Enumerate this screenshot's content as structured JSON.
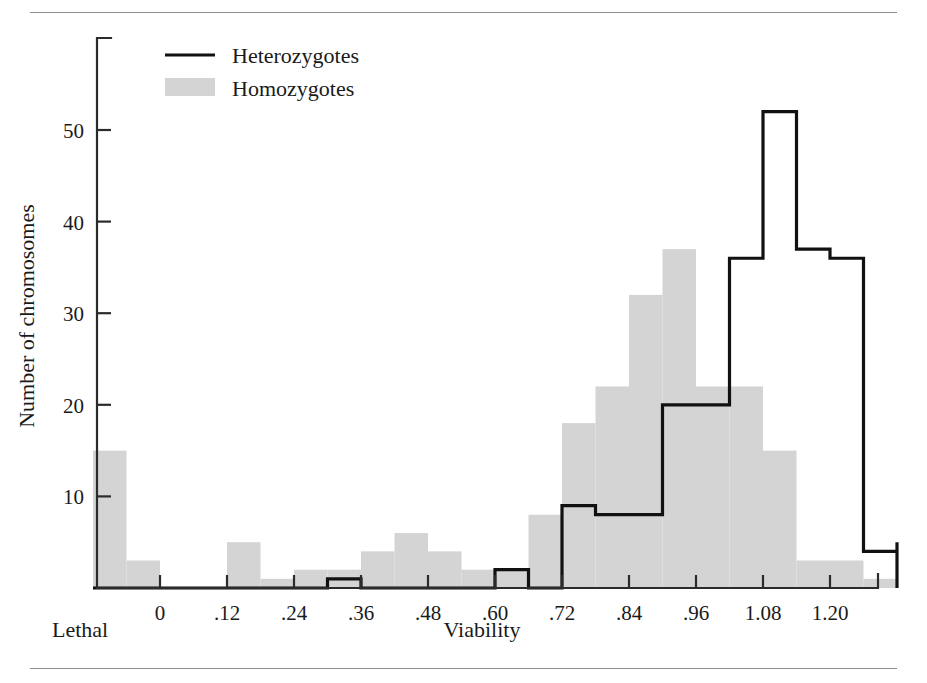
{
  "figure": {
    "rules": {
      "top": "horizontal-rule",
      "bottom": "horizontal-rule"
    },
    "corner_label_left": "Lethal",
    "axis_title_x": "Viability",
    "axis_title_y": "Number of chromosomes"
  },
  "legend": {
    "position": "top-left-inside",
    "entries": [
      {
        "label": "Heterozygotes",
        "marker": "line",
        "color": "#111111"
      },
      {
        "label": "Homozygotes",
        "marker": "swatch",
        "color": "#d4d4d4"
      }
    ]
  },
  "colors": {
    "heterozygote_line": "#111111",
    "homozygote_fill": "#d4d4d4",
    "axis": "#2b2b2b",
    "rule": "#8d8d8d",
    "background": "#ffffff"
  },
  "chart_data": {
    "type": "bar",
    "title": "",
    "subtitle": "",
    "xlabel": "Viability",
    "ylabel": "Number of chromosomes",
    "xlim": [
      -0.12,
      1.32
    ],
    "ylim": [
      0,
      55
    ],
    "grid": false,
    "legend_position": "top-left",
    "bin_width": 0.06,
    "x_ticks": [
      "0",
      ".12",
      ".24",
      ".36",
      ".48",
      ".60",
      ".72",
      ".84",
      ".96",
      "1.08",
      "1.20"
    ],
    "x_tick_values": [
      0,
      0.12,
      0.24,
      0.36,
      0.48,
      0.6,
      0.72,
      0.84,
      0.96,
      1.08,
      1.2
    ],
    "y_ticks": [
      "10",
      "20",
      "30",
      "40",
      "50"
    ],
    "y_tick_values": [
      10,
      20,
      30,
      40,
      50
    ],
    "bin_edges": [
      -0.12,
      -0.06,
      0.0,
      0.06,
      0.12,
      0.18,
      0.24,
      0.3,
      0.36,
      0.42,
      0.48,
      0.54,
      0.6,
      0.66,
      0.72,
      0.78,
      0.84,
      0.9,
      0.96,
      1.02,
      1.08,
      1.14,
      1.2,
      1.26,
      1.32
    ],
    "series": [
      {
        "name": "Homozygotes",
        "style": "filled-bars",
        "color": "#d4d4d4",
        "values": [
          15,
          3,
          0,
          0,
          5,
          1,
          2,
          4,
          6,
          4,
          2,
          2,
          0,
          8,
          18,
          22,
          32,
          37,
          22,
          22,
          15,
          3,
          3,
          1
        ]
      },
      {
        "name": "Heterozygotes",
        "style": "step-outline",
        "color": "#111111",
        "values": [
          0,
          0,
          0,
          0,
          0,
          0,
          0,
          1,
          1,
          0,
          0,
          0,
          0,
          2,
          0,
          9,
          8,
          8,
          20,
          20,
          36,
          52,
          37,
          36,
          4,
          4,
          5,
          5
        ]
      }
    ],
    "heterozygote_steps": [
      {
        "x0": -0.12,
        "x1": 0.3,
        "y": 0
      },
      {
        "x0": 0.3,
        "x1": 0.36,
        "y": 1
      },
      {
        "x0": 0.36,
        "x1": 0.6,
        "y": 0
      },
      {
        "x0": 0.6,
        "x1": 0.66,
        "y": 2
      },
      {
        "x0": 0.66,
        "x1": 0.72,
        "y": 0
      },
      {
        "x0": 0.72,
        "x1": 0.78,
        "y": 9
      },
      {
        "x0": 0.78,
        "x1": 0.9,
        "y": 8
      },
      {
        "x0": 0.9,
        "x1": 1.02,
        "y": 20
      },
      {
        "x0": 1.02,
        "x1": 1.08,
        "y": 36
      },
      {
        "x0": 1.08,
        "x1": 1.14,
        "y": 52
      },
      {
        "x0": 1.14,
        "x1": 1.2,
        "y": 37
      },
      {
        "x0": 1.2,
        "x1": 1.26,
        "y": 36
      },
      {
        "x0": 1.26,
        "x1": 1.32,
        "y": 4
      },
      {
        "x0": 1.32,
        "x1": 1.38,
        "y": 5
      }
    ],
    "homozygote_bars": [
      {
        "x0": -0.12,
        "x1": -0.06,
        "y": 15
      },
      {
        "x0": -0.06,
        "x1": 0.0,
        "y": 3
      },
      {
        "x0": 0.0,
        "x1": 0.06,
        "y": 0
      },
      {
        "x0": 0.06,
        "x1": 0.12,
        "y": 0
      },
      {
        "x0": 0.12,
        "x1": 0.18,
        "y": 5
      },
      {
        "x0": 0.18,
        "x1": 0.24,
        "y": 1
      },
      {
        "x0": 0.24,
        "x1": 0.3,
        "y": 2
      },
      {
        "x0": 0.3,
        "x1": 0.36,
        "y": 2
      },
      {
        "x0": 0.36,
        "x1": 0.42,
        "y": 4
      },
      {
        "x0": 0.42,
        "x1": 0.48,
        "y": 6
      },
      {
        "x0": 0.48,
        "x1": 0.54,
        "y": 4
      },
      {
        "x0": 0.54,
        "x1": 0.6,
        "y": 2
      },
      {
        "x0": 0.6,
        "x1": 0.66,
        "y": 2
      },
      {
        "x0": 0.66,
        "x1": 0.72,
        "y": 8
      },
      {
        "x0": 0.72,
        "x1": 0.78,
        "y": 18
      },
      {
        "x0": 0.78,
        "x1": 0.84,
        "y": 22
      },
      {
        "x0": 0.84,
        "x1": 0.9,
        "y": 32
      },
      {
        "x0": 0.9,
        "x1": 0.96,
        "y": 37
      },
      {
        "x0": 0.96,
        "x1": 1.02,
        "y": 22
      },
      {
        "x0": 1.02,
        "x1": 1.08,
        "y": 22
      },
      {
        "x0": 1.08,
        "x1": 1.14,
        "y": 15
      },
      {
        "x0": 1.14,
        "x1": 1.2,
        "y": 3
      },
      {
        "x0": 1.2,
        "x1": 1.26,
        "y": 3
      },
      {
        "x0": 1.26,
        "x1": 1.32,
        "y": 1
      }
    ]
  }
}
